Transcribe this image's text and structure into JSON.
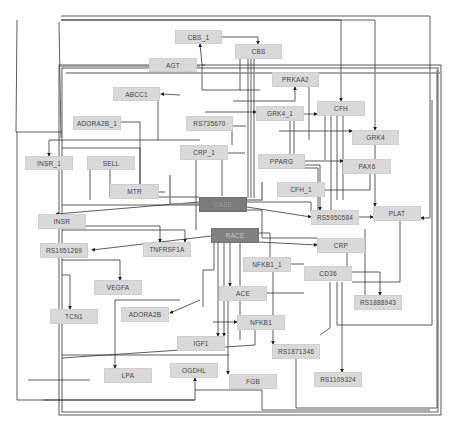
{
  "diagram": {
    "type": "gene-interaction-network",
    "colors": {
      "node_fill": "#d9d9d9",
      "hub_fill": "#7a7a7a",
      "edge": "#333333",
      "background": "#ffffff"
    },
    "nodes": [
      {
        "id": "CBS_1",
        "label": "CBS_1",
        "x": 175,
        "y": 30,
        "w": 47,
        "h": 14
      },
      {
        "id": "CBS",
        "label": "CBS",
        "x": 235,
        "y": 44,
        "w": 47,
        "h": 15
      },
      {
        "id": "AGT",
        "label": "AGT",
        "x": 149,
        "y": 58,
        "w": 48,
        "h": 14
      },
      {
        "id": "PRKAA2",
        "label": "PRKAA2",
        "x": 272,
        "y": 72,
        "w": 47,
        "h": 15
      },
      {
        "id": "ABCC1",
        "label": "ABCC1",
        "x": 113,
        "y": 87,
        "w": 47,
        "h": 14
      },
      {
        "id": "CFH",
        "label": "CFH",
        "x": 317,
        "y": 101,
        "w": 48,
        "h": 15
      },
      {
        "id": "ADORA2B_1",
        "label": "ADORA2B_1",
        "x": 73,
        "y": 116,
        "w": 48,
        "h": 14
      },
      {
        "id": "RS735670",
        "label": "RS735670",
        "x": 186,
        "y": 116,
        "w": 47,
        "h": 15
      },
      {
        "id": "GRK4_1",
        "label": "GRK4_1",
        "x": 256,
        "y": 106,
        "w": 48,
        "h": 15
      },
      {
        "id": "GRK4",
        "label": "GRK4",
        "x": 352,
        "y": 130,
        "w": 47,
        "h": 15
      },
      {
        "id": "CRP_1",
        "label": "CRP_1",
        "x": 180,
        "y": 145,
        "w": 48,
        "h": 15
      },
      {
        "id": "PPARG",
        "label": "PPARG",
        "x": 258,
        "y": 154,
        "w": 47,
        "h": 15
      },
      {
        "id": "INSR_1",
        "label": "INSR_1",
        "x": 25,
        "y": 156,
        "w": 48,
        "h": 14
      },
      {
        "id": "SELL",
        "label": "SELL",
        "x": 87,
        "y": 156,
        "w": 48,
        "h": 14
      },
      {
        "id": "PAX6",
        "label": "PAX6",
        "x": 343,
        "y": 159,
        "w": 48,
        "h": 15
      },
      {
        "id": "MTR",
        "label": "MTR",
        "x": 110,
        "y": 184,
        "w": 49,
        "h": 15
      },
      {
        "id": "CFH_1",
        "label": "CFH_1",
        "x": 277,
        "y": 182,
        "w": 48,
        "h": 15
      },
      {
        "id": "CASE",
        "label": "CASE",
        "x": 199,
        "y": 197,
        "w": 48,
        "h": 15,
        "style": "hub"
      },
      {
        "id": "INSR",
        "label": "INSR",
        "x": 38,
        "y": 214,
        "w": 48,
        "h": 15
      },
      {
        "id": "RS5950584",
        "label": "RS5950584",
        "x": 311,
        "y": 210,
        "w": 48,
        "h": 15
      },
      {
        "id": "PLAT",
        "label": "PLAT",
        "x": 373,
        "y": 206,
        "w": 48,
        "h": 15
      },
      {
        "id": "RACE",
        "label": "RACE",
        "x": 211,
        "y": 228,
        "w": 48,
        "h": 15,
        "style": "hub2"
      },
      {
        "id": "RS1951269",
        "label": "RS1951269",
        "x": 40,
        "y": 243,
        "w": 48,
        "h": 15
      },
      {
        "id": "TNFRSF1A",
        "label": "TNFRSF1A",
        "x": 143,
        "y": 242,
        "w": 48,
        "h": 15
      },
      {
        "id": "CRP",
        "label": "CRP",
        "x": 317,
        "y": 238,
        "w": 48,
        "h": 15
      },
      {
        "id": "NFKB1_1",
        "label": "NFKB1_1",
        "x": 243,
        "y": 257,
        "w": 48,
        "h": 15
      },
      {
        "id": "VEGFA",
        "label": "VEGFA",
        "x": 94,
        "y": 280,
        "w": 48,
        "h": 15
      },
      {
        "id": "CD36",
        "label": "CD36",
        "x": 304,
        "y": 266,
        "w": 48,
        "h": 15
      },
      {
        "id": "ACE",
        "label": "ACE",
        "x": 219,
        "y": 286,
        "w": 48,
        "h": 15
      },
      {
        "id": "TCN1",
        "label": "TCN1",
        "x": 50,
        "y": 309,
        "w": 48,
        "h": 15
      },
      {
        "id": "ADORA2B",
        "label": "ADORA2B",
        "x": 121,
        "y": 307,
        "w": 48,
        "h": 15
      },
      {
        "id": "RS1888943",
        "label": "RS1888943",
        "x": 354,
        "y": 295,
        "w": 48,
        "h": 15
      },
      {
        "id": "NFKB1",
        "label": "NFKB1",
        "x": 237,
        "y": 315,
        "w": 48,
        "h": 15
      },
      {
        "id": "IGF1",
        "label": "IGF1",
        "x": 177,
        "y": 336,
        "w": 48,
        "h": 15
      },
      {
        "id": "RS1871346",
        "label": "RS1871346",
        "x": 272,
        "y": 344,
        "w": 48,
        "h": 15
      },
      {
        "id": "LPA",
        "label": "LPA",
        "x": 104,
        "y": 368,
        "w": 48,
        "h": 15
      },
      {
        "id": "OGDHL",
        "label": "OGDHL",
        "x": 170,
        "y": 363,
        "w": 48,
        "h": 15
      },
      {
        "id": "FGB",
        "label": "FGB",
        "x": 229,
        "y": 374,
        "w": 48,
        "h": 15
      },
      {
        "id": "RS1109324",
        "label": "RS1109324",
        "x": 314,
        "y": 372,
        "w": 48,
        "h": 15
      }
    ]
  }
}
